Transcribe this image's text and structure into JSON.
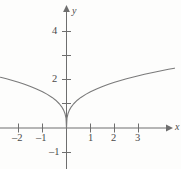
{
  "figure": {
    "panel_tag": ")",
    "background_color": "#fdfdfc",
    "axis_color": "#6e6e6e",
    "curve_color": "#7a7a7a",
    "label_color": "#4a4a4a"
  },
  "chart_data": {
    "type": "line",
    "title": "",
    "subtitle": "",
    "xlabel": "x",
    "ylabel": "y",
    "grid": false,
    "legend": null,
    "xlim": [
      -2.75,
      4.6
    ],
    "ylim": [
      -1.7,
      5.1
    ],
    "x_ticks": [
      -2,
      -1,
      1,
      2,
      3
    ],
    "x_tick_labels": [
      "–2",
      "–1",
      "1",
      "2",
      "3"
    ],
    "y_ticks": [
      -1,
      2,
      4
    ],
    "y_tick_labels": [
      "–1",
      "2",
      "4"
    ],
    "origin_label": "",
    "series": [
      {
        "name": "y = 2·|x|^(1/3)",
        "x": [
          -2.75,
          -2.5,
          -2.25,
          -2,
          -1.75,
          -1.5,
          -1.25,
          -1,
          -0.8,
          -0.6,
          -0.45,
          -0.3,
          -0.2,
          -0.12,
          -0.06,
          -0.02,
          0,
          0.02,
          0.06,
          0.12,
          0.2,
          0.3,
          0.45,
          0.6,
          0.8,
          1,
          1.25,
          1.5,
          1.75,
          2,
          2.25,
          2.5,
          2.75,
          3,
          3.25,
          3.5,
          3.75,
          4,
          4.25,
          4.5
        ],
        "y": [
          2.12,
          2.06,
          1.99,
          1.91,
          1.83,
          1.74,
          1.63,
          1.51,
          1.41,
          1.28,
          1.16,
          1.01,
          0.88,
          0.75,
          0.59,
          0.41,
          0,
          0.41,
          0.59,
          0.75,
          0.88,
          1.01,
          1.16,
          1.28,
          1.41,
          1.51,
          1.63,
          1.74,
          1.83,
          1.91,
          1.99,
          2.06,
          2.12,
          1.96,
          2.02,
          2.07,
          2.12,
          2.16,
          2.2,
          2.24
        ]
      }
    ],
    "annotations": [
      {
        "text": "cusp at origin",
        "x": 0,
        "y": 0
      }
    ]
  },
  "labels": {
    "y_axis_name": "y",
    "x_axis_name": "x",
    "y_4": "4",
    "y_2": "2",
    "y_neg1": "–1",
    "x_neg2": "–2",
    "x_neg1": "–1",
    "x_1": "1",
    "x_2": "2",
    "x_3": "3"
  }
}
